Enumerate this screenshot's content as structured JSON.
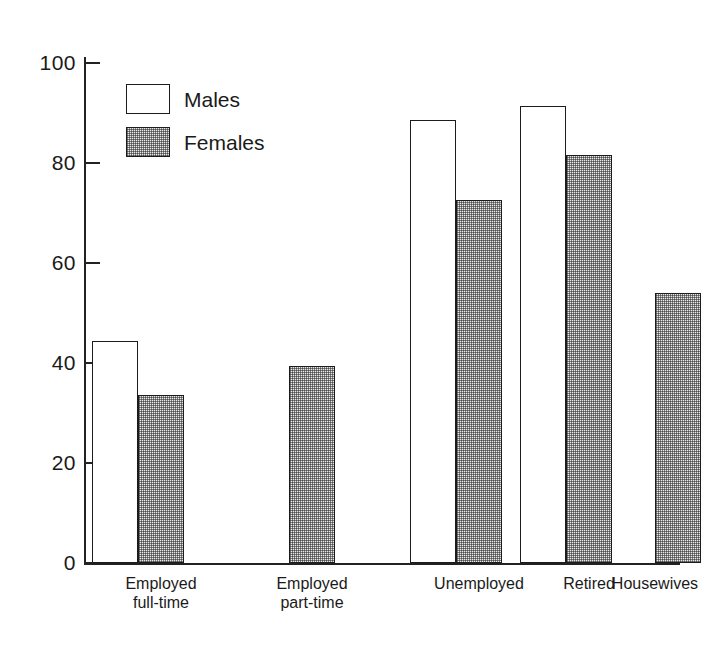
{
  "chart_data": {
    "type": "bar",
    "title": "",
    "subtitle": "",
    "xlabel": "",
    "ylabel": "",
    "ylim": [
      0,
      100
    ],
    "yticks": [
      0,
      20,
      40,
      60,
      80,
      100
    ],
    "grid": false,
    "legend_position": "top-left",
    "categories": [
      "Employed\nfull-time",
      "Employed\npart-time",
      "Unemployed",
      "Retired",
      "Housewives"
    ],
    "series": [
      {
        "name": "Males",
        "fill": "white",
        "values": [
          44.5,
          null,
          88.6,
          91.4,
          null
        ]
      },
      {
        "name": "Females",
        "fill": "stipple",
        "values": [
          33.7,
          39.5,
          72.7,
          81.6,
          54.0
        ]
      }
    ]
  },
  "axis": {
    "y_tick_labels": [
      "100",
      "80",
      "60",
      "40",
      "20",
      "0"
    ]
  },
  "legend": {
    "items": [
      {
        "label": "Males",
        "swatch": "white-box-swatch"
      },
      {
        "label": "Females",
        "swatch": "stipple-box-swatch"
      }
    ]
  },
  "colors": {
    "ink": "#1c1c1c",
    "background": "#ffffff",
    "stipple_fill": "#e9e9e9"
  }
}
